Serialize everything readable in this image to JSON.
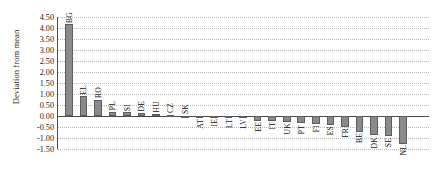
{
  "chart_data": {
    "type": "bar",
    "title": "",
    "xlabel": "",
    "ylabel": "Deviation from mean",
    "ylim": [
      -1.5,
      4.5
    ],
    "ytick_step": 0.5,
    "ytick_labels": [
      "4.50",
      "4.00",
      "3.50",
      "3.00",
      "2.50",
      "2.00",
      "1.50",
      "1.00",
      "0.50",
      "0.00",
      "-0.50",
      "-1.00",
      "-1.50"
    ],
    "grid": true,
    "legend": "none",
    "bar_color": "#8a8a8a",
    "bar_border_color": "#5d5d5d",
    "axis_color": "#4a4a4a",
    "gridline_color": "#b9b9b9",
    "categories": [
      "BG",
      "EL",
      "RO",
      "PL",
      "SI",
      "DE",
      "HU",
      "CZ",
      "SK",
      "AT",
      "IE",
      "LT",
      "LV",
      "EE",
      "IT",
      "UK",
      "PT",
      "FI",
      "ES",
      "FR",
      "BE",
      "DK",
      "SE",
      "NL"
    ],
    "values": [
      4.17,
      0.92,
      0.75,
      0.2,
      0.17,
      0.15,
      0.09,
      0.06,
      0.01,
      -0.06,
      -0.07,
      -0.08,
      -0.09,
      -0.22,
      -0.22,
      -0.26,
      -0.34,
      -0.36,
      -0.4,
      -0.48,
      -0.72,
      -0.88,
      -0.92,
      -1.25
    ]
  }
}
